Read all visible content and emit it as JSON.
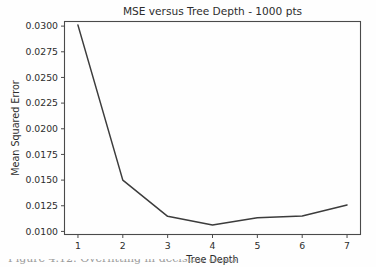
{
  "figure": {
    "background_color": "#fefefe",
    "caption_partial": "Figure 4.12: Overfitting in decision trees"
  },
  "chart_data": {
    "type": "line",
    "title": "MSE versus Tree Depth - 1000 pts",
    "xlabel": "Tree Depth",
    "ylabel": "Mean Squared Error",
    "x": [
      1,
      2,
      3,
      4,
      5,
      6,
      7
    ],
    "values": [
      0.0301,
      0.015,
      0.01147,
      0.01062,
      0.01134,
      0.0115,
      0.01257
    ],
    "xticks": [
      "1",
      "2",
      "3",
      "4",
      "5",
      "6",
      "7"
    ],
    "yticks": [
      "0.0100",
      "0.0125",
      "0.0150",
      "0.0175",
      "0.0200",
      "0.0225",
      "0.0250",
      "0.0275",
      "0.0300"
    ],
    "ytick_values": [
      0.01,
      0.0125,
      0.015,
      0.0175,
      0.02,
      0.0225,
      0.025,
      0.0275,
      0.03
    ],
    "xlim": [
      0.7,
      7.3
    ],
    "ylim": [
      0.0097,
      0.03045
    ],
    "grid": false,
    "legend": false,
    "line_color": "#3c3c3c",
    "axis_color": "#4a4a4a"
  }
}
